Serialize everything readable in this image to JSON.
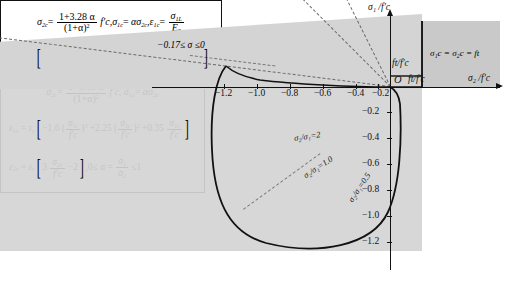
{
  "figure": {
    "type": "biaxial-failure-envelope",
    "annotation_top": "−0.17≤ σ ≤0",
    "region_label": "σ₁c = σ₂c = ft"
  },
  "axes": {
    "y_label": "σ₁ /f'c",
    "x_label": "σ₂ /f'c",
    "origin_label": "O",
    "tension_label_y": "ft/f'c",
    "tension_label_x": "ft/f'c",
    "x_ticks": [
      "−1.2",
      "−1.0",
      "−0.8",
      "−0.6",
      "−0.4",
      "−0.2"
    ],
    "y_ticks": [
      "−0.2",
      "−0.4",
      "−0.6",
      "−0.8",
      "−1.0",
      "−1.2"
    ]
  },
  "ratio_lines": [
    {
      "label": "σ₂/σ₁=2",
      "value": 2.0
    },
    {
      "label": "σ₂/σ₁=1.0",
      "value": 1.0
    },
    {
      "label": "σ₂/σ₁=0.5",
      "value": 0.5
    }
  ],
  "box1": {
    "line1": {
      "lhs": "σ",
      "lhs_sub": "2c",
      "num": "1+3.28 α",
      "den": "(1+α)",
      "den_sup": "2",
      "fc": "f'c",
      "t2_lhs": "σ",
      "t2_sub": "1c",
      "t2_rhs": "ασ",
      "t2_rhs_sub": "2c",
      "t3_lhs": "ε",
      "t3_sub": "1c",
      "t3_num": "σ",
      "t3_num_sub": "1L",
      "t3_den": "E",
      "t3_den_sub": "0"
    },
    "line2": {
      "lhs": "ε",
      "lhs_sub": "2c",
      "eps": "ε",
      "eps_sub": "c",
      "c0": "4.42−8.38",
      "c1": "+7.54",
      "c1_sup": "2",
      "c2": "−2.58",
      "c2_sup": "3",
      "ratio_num": "σ",
      "ratio_num_sub": "2c",
      "ratio_den": "f'c"
    }
  },
  "box2": {
    "line1": {
      "lhs": "σ",
      "lhs_sub": "2c",
      "num": "1+3.65 α",
      "den": "(1+α)",
      "den_sup": "2",
      "fc": "f'c",
      "t2_lhs": "σ",
      "t2_sub": "1c",
      "t2_rhs": "ασ",
      "t2_rhs_sub": "2c"
    },
    "line2": {
      "lhs": "ε",
      "lhs_sub": "1c",
      "eps": "ε",
      "eps_sub": "c",
      "c0": "−1.6",
      "c0_sup": "3",
      "c1": "+2.25",
      "c1_sup": "2",
      "c2": "+0.35",
      "ratio_num": "σ",
      "ratio_num_sub": "1c",
      "ratio_den": "f'c"
    },
    "line3": {
      "lhs": "ε",
      "lhs_sub": "2c",
      "eps": "ε",
      "eps_sub": "c",
      "c0": "3",
      "ratio_num": "σ",
      "ratio_num_sub": "2c",
      "ratio_den": "f'c",
      "c1": "−2",
      "cond_pre": "0≤ α =",
      "cond_num": "σ",
      "cond_num_sub": "1",
      "cond_den": "σ",
      "cond_den_sub": "2",
      "cond_post": "≤1"
    }
  }
}
